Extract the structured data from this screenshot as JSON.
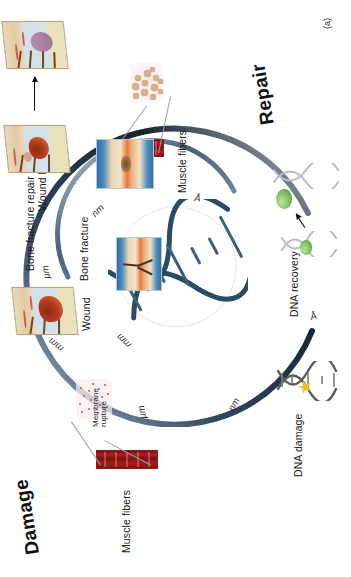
{
  "figure": {
    "panel_label": "(a)",
    "background_color": "#ffffff",
    "orientation": "rotated-90-ccw"
  },
  "headers": {
    "damage": "Damage",
    "repair": "Repair"
  },
  "scale_spiral": {
    "description": "Double spiral spanning biological length scales from angstrom to millimetre",
    "outer_arm_labels": [
      "Å",
      "nm",
      "µm",
      "mm"
    ],
    "inner_arm_labels": [
      "Å",
      "nm",
      "µm",
      "mm"
    ],
    "colors": {
      "outer_arm": "#1b2a3a",
      "inner_arm": "#8fa3b5"
    }
  },
  "damage_side": {
    "labels": {
      "dna_damage": "DNA damage",
      "muscle_fibers": "Muscle fibers",
      "membrane_rupture": "Membrane rupture",
      "wound": "Wound",
      "bone_fracture": "Bone fracture"
    }
  },
  "repair_side": {
    "labels": {
      "dna_recovery": "DNA recovery",
      "muscle_fibers": "Muscle fibers",
      "wound_healing": "Wound healing",
      "bone_fracture_repair": "Bone fracture repair"
    }
  },
  "colors": {
    "muscle_red": "#8e1d1d",
    "bone_blue": "#2f6fa8",
    "bone_marrow_orange": "#e8773c",
    "enzyme_green": "#7cb85a",
    "damage_star_yellow": "#f5c125",
    "text": "#1a1a1a"
  }
}
